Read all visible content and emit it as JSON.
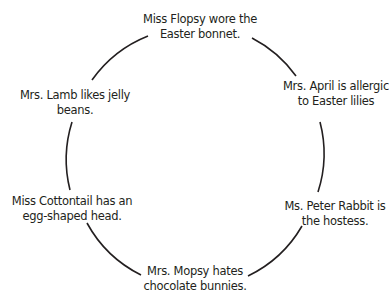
{
  "diagram": {
    "type": "cycle",
    "line_color": "#231f20",
    "nodes": [
      {
        "id": "top",
        "line1": "Miss Flopsy wore the",
        "line2": "Easter bonnet."
      },
      {
        "id": "upper-right",
        "line1": "Mrs. April is allergic",
        "line2": "to Easter lilies"
      },
      {
        "id": "lower-right",
        "line1": "Ms. Peter Rabbit is",
        "line2": "the hostess."
      },
      {
        "id": "bottom",
        "line1": "Mrs. Mopsy hates",
        "line2": "chocolate bunnies."
      },
      {
        "id": "lower-left",
        "line1": "Miss Cottontail has an",
        "line2": "egg-shaped head."
      },
      {
        "id": "upper-left",
        "line1": "Mrs. Lamb likes jelly",
        "line2": "beans."
      }
    ]
  }
}
